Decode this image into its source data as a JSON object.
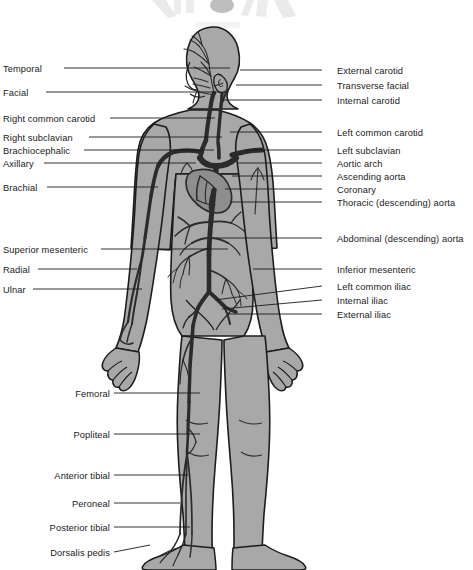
{
  "figure": {
    "width": 473,
    "height": 570
  },
  "colors": {
    "background": "#ffffff",
    "body_fill": "#a8a8a8",
    "body_outline": "#1c1c1c",
    "artery": "#2b2b2b",
    "artery_light": "#3a3a3a",
    "label_text": "#1a1a1a",
    "leader_line": "#1c1c1c",
    "heart_fill": "#8e8e8e",
    "top_artifact": "#d8d8d8"
  },
  "labels_left": [
    {
      "id": "temporal",
      "text": "Temporal",
      "x": 3,
      "y": 64,
      "line": [
        64,
        68,
        230,
        68
      ]
    },
    {
      "id": "facial",
      "text": "Facial",
      "x": 3,
      "y": 88,
      "line": [
        46,
        92,
        225,
        92
      ]
    },
    {
      "id": "right-common-carotid",
      "text": "Right common carotid",
      "x": 3,
      "y": 114,
      "line": [
        110,
        118,
        215,
        118
      ]
    },
    {
      "id": "right-subclavian",
      "text": "Right subclavian",
      "x": 3,
      "y": 133,
      "line": [
        89,
        137,
        222,
        137
      ]
    },
    {
      "id": "brachiocephalic",
      "text": "Brachiocephalic",
      "x": 3,
      "y": 146,
      "line": [
        84,
        150,
        214,
        150
      ]
    },
    {
      "id": "axillary",
      "text": "Axillary",
      "x": 3,
      "y": 159,
      "line": [
        44,
        163,
        196,
        163
      ]
    },
    {
      "id": "brachial",
      "text": "Brachial",
      "x": 3,
      "y": 183,
      "line": [
        47,
        187,
        158,
        187
      ]
    },
    {
      "id": "superior-mesenteric",
      "text": "Superior mesenteric",
      "x": 3,
      "y": 245,
      "line": [
        101,
        249,
        228,
        249
      ]
    },
    {
      "id": "radial",
      "text": "Radial",
      "x": 3,
      "y": 265,
      "line": [
        38,
        269,
        137,
        269
      ]
    },
    {
      "id": "ulnar",
      "text": "Ulnar",
      "x": 3,
      "y": 285,
      "line": [
        33,
        289,
        142,
        289
      ]
    }
  ],
  "labels_leg": [
    {
      "id": "femoral",
      "text": "Femoral",
      "x": 110,
      "y": 389,
      "line": [
        114,
        393,
        200,
        393
      ]
    },
    {
      "id": "popliteal",
      "text": "Popliteal",
      "x": 110,
      "y": 430,
      "line": [
        114,
        434,
        200,
        434
      ]
    },
    {
      "id": "anterior-tibial",
      "text": "Anterior tibial",
      "x": 110,
      "y": 471,
      "line": [
        114,
        475,
        188,
        475
      ]
    },
    {
      "id": "peroneal",
      "text": "Peroneal",
      "x": 110,
      "y": 499,
      "line": [
        114,
        503,
        180,
        503
      ]
    },
    {
      "id": "posterior-tibial",
      "text": "Posterior tibial",
      "x": 110,
      "y": 523,
      "line": [
        114,
        527,
        190,
        527
      ]
    },
    {
      "id": "dorsalis-pedis",
      "text": "Dorsalis pedis",
      "x": 110,
      "y": 548,
      "line": [
        114,
        552,
        150,
        545
      ]
    }
  ],
  "labels_right": [
    {
      "id": "external-carotid",
      "text": "External carotid",
      "x": 337,
      "y": 66,
      "line": [
        322,
        70,
        240,
        70
      ]
    },
    {
      "id": "transverse-facial",
      "text": "Transverse facial",
      "x": 337,
      "y": 81,
      "line": [
        322,
        85,
        236,
        85
      ]
    },
    {
      "id": "internal-carotid",
      "text": "Internal carotid",
      "x": 337,
      "y": 96,
      "line": [
        322,
        100,
        222,
        100
      ]
    },
    {
      "id": "left-common-carotid",
      "text": "Left common carotid",
      "x": 337,
      "y": 128,
      "line": [
        322,
        132,
        230,
        132
      ]
    },
    {
      "id": "left-subclavian",
      "text": "Left subclavian",
      "x": 337,
      "y": 146,
      "line": [
        322,
        150,
        245,
        150
      ]
    },
    {
      "id": "aortic-arch",
      "text": "Aortic arch",
      "x": 337,
      "y": 159,
      "line": [
        322,
        163,
        237,
        163
      ]
    },
    {
      "id": "ascending-aorta",
      "text": "Ascending aorta",
      "x": 337,
      "y": 172,
      "line": [
        322,
        176,
        232,
        176
      ]
    },
    {
      "id": "coronary",
      "text": "Coronary",
      "x": 337,
      "y": 185,
      "line": [
        322,
        189,
        225,
        189
      ]
    },
    {
      "id": "thoracic-descending-aorta",
      "text": "Thoracic (descending) aorta",
      "x": 337,
      "y": 198,
      "line": [
        322,
        202,
        230,
        202
      ]
    },
    {
      "id": "abdominal-descending-aorta",
      "text": "Abdominal (descending) aorta",
      "x": 337,
      "y": 234,
      "line": [
        322,
        238,
        216,
        238
      ]
    },
    {
      "id": "inferior-mesenteric",
      "text": "Inferior mesenteric",
      "x": 337,
      "y": 265,
      "line": [
        322,
        269,
        253,
        269
      ]
    },
    {
      "id": "left-common-iliac",
      "text": "Left common iliac",
      "x": 337,
      "y": 282,
      "line": [
        322,
        286,
        215,
        300
      ]
    },
    {
      "id": "internal-iliac",
      "text": "Internal iliac",
      "x": 337,
      "y": 296,
      "line": [
        322,
        300,
        222,
        309
      ]
    },
    {
      "id": "external-iliac",
      "text": "External iliac",
      "x": 337,
      "y": 310,
      "line": [
        322,
        314,
        228,
        314
      ]
    }
  ]
}
